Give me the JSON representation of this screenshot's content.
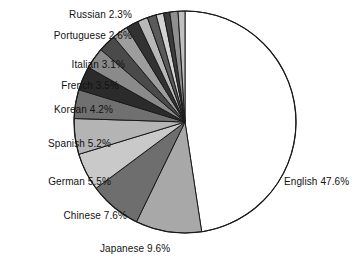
{
  "chart_data": {
    "type": "pie",
    "title": "",
    "subtitle": "",
    "xlabel": "",
    "ylabel": "",
    "legend_position": "none",
    "grid": false,
    "units": "percent",
    "labels_show_percent": true,
    "start_angle_deg": 0,
    "direction": "clockwise",
    "categories": [
      "English",
      "Japanese",
      "Chinese",
      "German",
      "Spanish",
      "Korean",
      "French",
      "Italian",
      "Portuguese",
      "Russian",
      "Other 1",
      "Other 2",
      "Other 3",
      "Other 4",
      "Other 5",
      "Other 6",
      "Other 7"
    ],
    "values": [
      47.6,
      9.6,
      7.6,
      5.5,
      5.2,
      4.2,
      3.5,
      3.1,
      2.6,
      2.3,
      1.8,
      1.5,
      1.3,
      1.1,
      0.9,
      1.2,
      1.0
    ],
    "colors": [
      "#ffffff",
      "#a8a8a8",
      "#6e6e6e",
      "#c9c9c9",
      "#b4b4b4",
      "#707070",
      "#2b2b2b",
      "#8a8a8a",
      "#4a4a4a",
      "#9d9d9d",
      "#323232",
      "#b8b8b8",
      "#5a5a5a",
      "#d2d2d2",
      "#3c3c3c",
      "#8f8f8f",
      "#c0c0c0"
    ],
    "slice_outline_color": "#1a1a1a",
    "labeled_slices": [
      {
        "name": "English",
        "percent": 47.6,
        "text": "English 47.6%"
      },
      {
        "name": "Japanese",
        "percent": 9.6,
        "text": "Japanese 9.6%"
      },
      {
        "name": "Chinese",
        "percent": 7.6,
        "text": "Chinese 7.6%"
      },
      {
        "name": "German",
        "percent": 5.5,
        "text": "German 5.5%"
      },
      {
        "name": "Spanish",
        "percent": 5.2,
        "text": "Spanish 5.2%"
      },
      {
        "name": "Korean",
        "percent": 4.2,
        "text": "Korean 4.2%"
      },
      {
        "name": "French",
        "percent": 3.5,
        "text": "French 3.5%"
      },
      {
        "name": "Italian",
        "percent": 3.1,
        "text": "Italian 3.1%"
      },
      {
        "name": "Portuguese",
        "percent": 2.6,
        "text": "Portuguese 2.6%"
      },
      {
        "name": "Russian",
        "percent": 2.3,
        "text": "Russian 2.3%"
      }
    ]
  },
  "labels": {
    "russian": "Russian 2.3%",
    "portuguese": "Portuguese 2.6%",
    "italian": "Italian 3.1%",
    "french": "French 3.5%",
    "korean": "Korean 4.2%",
    "spanish": "Spanish 5.2%",
    "german": "German 5.5%",
    "chinese": "Chinese 7.6%",
    "japanese": "Japanese 9.6%",
    "english": "English 47.6%"
  }
}
